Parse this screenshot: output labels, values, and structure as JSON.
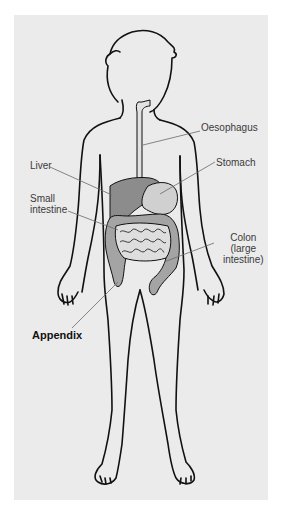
{
  "diagram": {
    "type": "anatomical-illustration",
    "colors": {
      "background": "#ffffff",
      "panel": "#ebebeb",
      "outline": "#111111",
      "liver": "#8c8c8c",
      "stomach": "#d0d0d0",
      "colon": "#a4a4a4",
      "small_intestine": "#dedede",
      "leader_line": "#6a6a6a"
    },
    "labels": {
      "oesophagus": "Oesophagus",
      "stomach": "Stomach",
      "liver": "Liver",
      "small_intestine_1": "Small",
      "small_intestine_2": "intestine",
      "colon_1": "Colon",
      "colon_2": "(large",
      "colon_3": "intestine)",
      "appendix": "Appendix"
    },
    "highlighted_label": "Appendix"
  }
}
